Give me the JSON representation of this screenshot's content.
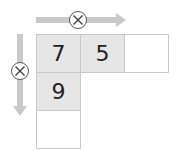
{
  "diagram": {
    "title": "",
    "horizontal_operator": {
      "symbol": "times",
      "direction": "right"
    },
    "vertical_operator": {
      "symbol": "times",
      "direction": "down"
    },
    "cells": {
      "r1c1": "7",
      "r1c2": "5",
      "r1c3": "",
      "r2c1": "9",
      "r3c1": ""
    },
    "colors": {
      "shaded": "#e6e6e6",
      "arrow": "#c9c9c9",
      "border": "#c8c8c8"
    }
  }
}
